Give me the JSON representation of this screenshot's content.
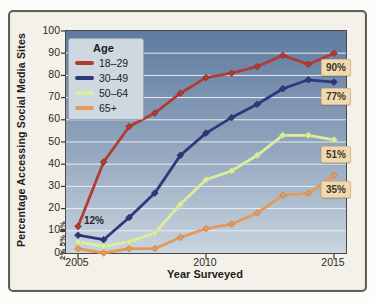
{
  "chart_data": {
    "type": "line",
    "title": "",
    "xlabel": "Year Surveyed",
    "ylabel": "Percentage Accessing Social Media Sites",
    "x": [
      2005,
      2006,
      2007,
      2008,
      2009,
      2010,
      2011,
      2012,
      2013,
      2014,
      2015
    ],
    "x_ticks": [
      2005,
      2010,
      2015
    ],
    "y_ticks": [
      0,
      10,
      20,
      30,
      40,
      50,
      60,
      70,
      80,
      90,
      100
    ],
    "ylim": [
      0,
      100
    ],
    "grid": true,
    "legend_title": "Age",
    "legend_position": "top-left",
    "series": [
      {
        "name": "18–29",
        "color": "#b23c32",
        "marker_edge": "#8a2d26",
        "values": [
          12,
          41,
          57,
          63,
          72,
          79,
          81,
          84,
          89,
          85,
          90
        ],
        "end_label": "90%"
      },
      {
        "name": "30–49",
        "color": "#32367c",
        "marker_edge": "#262a63",
        "values": [
          8,
          6,
          16,
          27,
          44,
          54,
          61,
          67,
          74,
          78,
          77
        ],
        "end_label": "77%"
      },
      {
        "name": "50–64",
        "color": "#dcee9d",
        "marker_edge": "#c0d87c",
        "values": [
          5,
          3,
          5,
          9,
          22,
          33,
          37,
          44,
          53,
          53,
          51
        ],
        "end_label": "51%"
      },
      {
        "name": "65+",
        "color": "#e39a5b",
        "marker_edge": "#ca7e41",
        "values": [
          2,
          0,
          2,
          2,
          7,
          11,
          13,
          18,
          26,
          27,
          35
        ],
        "end_label": "35%"
      }
    ],
    "annotations": {
      "red_2005": "12%",
      "stacked_2005": "2% 5% 8%"
    },
    "colors": {
      "plot_bg_top": "#5f7ba1",
      "plot_bg_mid": "#8da1ba",
      "plot_bg_bottom": "#c9d5df",
      "gridline": "#e6edf2",
      "axis_line": "#3a3833",
      "frame_bg": "#f3f1e9",
      "legend_bg": "#cdd8e1",
      "end_label_bg": "#f0d9ae",
      "end_label_text": "#3f362a"
    }
  }
}
